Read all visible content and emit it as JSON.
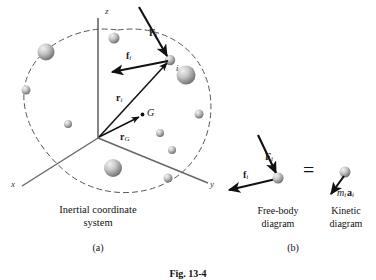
{
  "figure": {
    "number": "Fig. 13-4",
    "panels": [
      {
        "key": "a",
        "label": "(a)",
        "caption_line1": "Inertial coordinate",
        "caption_line2": "system"
      },
      {
        "key": "b",
        "label": "(b)",
        "left_caption_line1": "Free-body",
        "left_caption_line2": "diagram",
        "right_caption_line1": "Kinetic",
        "right_caption_line2": "diagram",
        "equals_symbol": "="
      }
    ]
  },
  "axes": {
    "z": "z",
    "x": "x",
    "y": "y"
  },
  "labels": {
    "external_force": {
      "symbol": "F",
      "sub": "i"
    },
    "internal_force": {
      "symbol": "f",
      "sub": "i"
    },
    "position_vector": {
      "symbol": "r",
      "sub": "i"
    },
    "mass_center_vector": {
      "symbol": "r",
      "sub": "G"
    },
    "mass_center_point": "G",
    "particle_index": "i",
    "inertia_term": {
      "mass": "m",
      "mass_sub": "i",
      "accel": "a",
      "accel_sub": "i"
    }
  },
  "colors": {
    "ink": "#1a1a1a",
    "axis": "#4a4a4a",
    "dashed_boundary": "#555555",
    "particle_light": "#e8e8e8",
    "particle_mid": "#9a9a9a",
    "particle_dark": "#6e6e6e",
    "background": "#ffffff"
  },
  "diagram_data": {
    "type": "physics-free-body-diagram",
    "origin": {
      "x": 98,
      "y": 138
    },
    "particle_i": {
      "x": 170,
      "y": 60
    },
    "mass_center_G": {
      "x": 142,
      "y": 116
    },
    "particles": [
      {
        "cx": 46,
        "cy": 52,
        "r": 8.5
      },
      {
        "cx": 26,
        "cy": 90,
        "r": 4.5
      },
      {
        "cx": 68,
        "cy": 124,
        "r": 4.0
      },
      {
        "cx": 114,
        "cy": 38,
        "r": 5.5
      },
      {
        "cx": 186,
        "cy": 75,
        "r": 9.5
      },
      {
        "cx": 199,
        "cy": 114,
        "r": 4.5
      },
      {
        "cx": 160,
        "cy": 133,
        "r": 4.0
      },
      {
        "cx": 172,
        "cy": 150,
        "r": 4.0
      },
      {
        "cx": 113,
        "cy": 168,
        "r": 9.0
      },
      {
        "cx": 168,
        "cy": 178,
        "r": 4.5
      },
      {
        "cx": 170,
        "cy": 60,
        "r": 5.0
      }
    ],
    "fbd_particle": {
      "cx": 278,
      "cy": 178,
      "r": 5.5
    },
    "kinetic_particle": {
      "cx": 345,
      "cy": 173,
      "r": 5.5
    }
  }
}
